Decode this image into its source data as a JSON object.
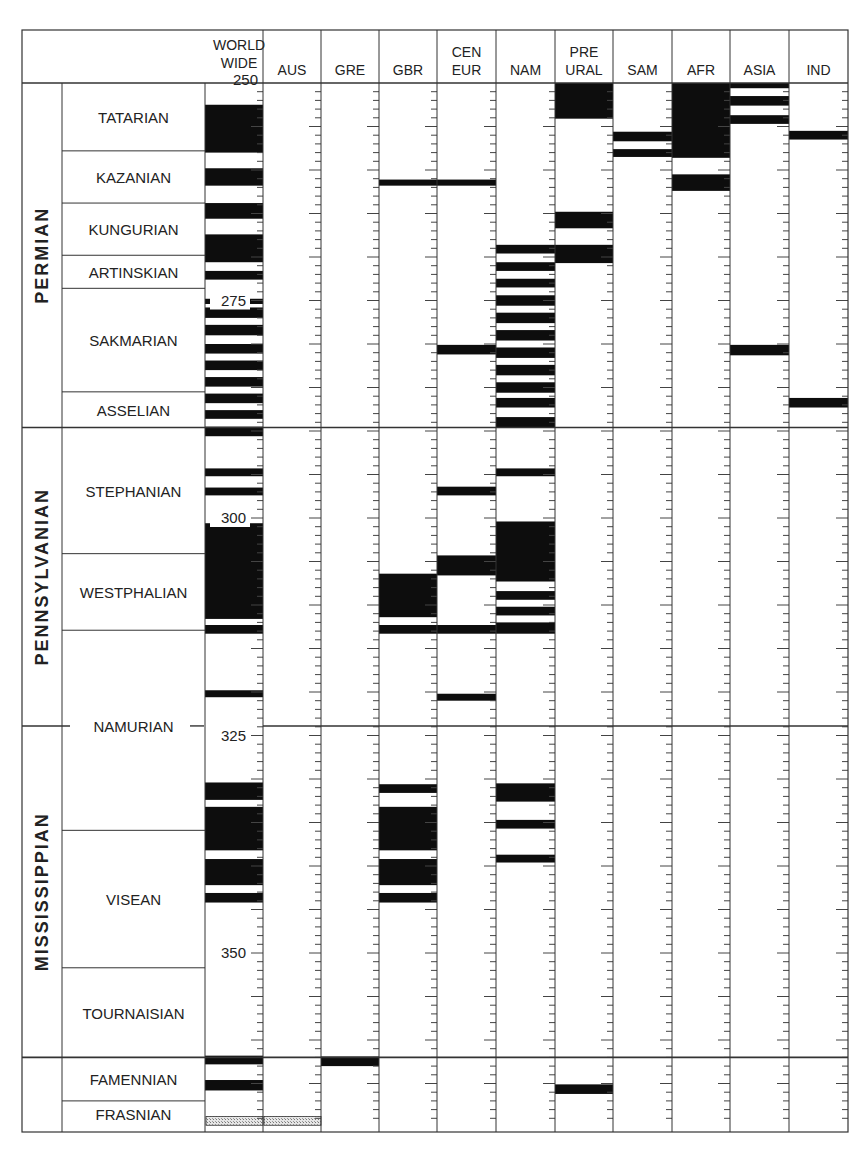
{
  "chart_data": {
    "type": "table",
    "y_axis": {
      "label": "Age (Ma)",
      "ticks": [
        250,
        275,
        300,
        325,
        350
      ],
      "range": [
        250,
        370
      ],
      "direction": "down"
    },
    "columns": [
      {
        "key": "WW",
        "label_lines": [
          "WORLD",
          "WIDE"
        ]
      },
      {
        "key": "AUS",
        "label_lines": [
          "AUS"
        ]
      },
      {
        "key": "GRE",
        "label_lines": [
          "GRE"
        ]
      },
      {
        "key": "GBR",
        "label_lines": [
          "GBR"
        ]
      },
      {
        "key": "CEUR",
        "label_lines": [
          "CEN",
          "EUR"
        ]
      },
      {
        "key": "NAM",
        "label_lines": [
          "NAM"
        ]
      },
      {
        "key": "PURAL",
        "label_lines": [
          "PRE",
          "URAL"
        ]
      },
      {
        "key": "SAM",
        "label_lines": [
          "SAM"
        ]
      },
      {
        "key": "AFR",
        "label_lines": [
          "AFR"
        ]
      },
      {
        "key": "ASIA",
        "label_lines": [
          "ASIA"
        ]
      },
      {
        "key": "IND",
        "label_lines": [
          "IND"
        ]
      }
    ],
    "periods": [
      {
        "name": "PERMIAN",
        "from": 250,
        "to": 289.6
      },
      {
        "name": "PENNSYLVANIAN",
        "from": 289.6,
        "to": 323.9
      },
      {
        "name": "MISSISSIPPIAN",
        "from": 323.9,
        "to": 362.0
      },
      {
        "name": "",
        "from": 362.0,
        "to": 370.0
      }
    ],
    "stages": [
      {
        "name": "TATARIAN",
        "from": 250,
        "to": 257.8
      },
      {
        "name": "KAZANIAN",
        "from": 257.8,
        "to": 263.8
      },
      {
        "name": "KUNGURIAN",
        "from": 263.8,
        "to": 269.8
      },
      {
        "name": "ARTINSKIAN",
        "from": 269.8,
        "to": 273.6
      },
      {
        "name": "SAKMARIAN",
        "from": 273.6,
        "to": 285.5
      },
      {
        "name": "ASSELIAN",
        "from": 285.5,
        "to": 289.6
      },
      {
        "name": "STEPHANIAN",
        "from": 289.6,
        "to": 304.1
      },
      {
        "name": "WESTPHALIAN",
        "from": 304.1,
        "to": 312.9
      },
      {
        "name": "NAMURIAN",
        "from": 312.9,
        "to": 335.9,
        "label_at": 323.9
      },
      {
        "name": "VISEAN",
        "from": 335.9,
        "to": 351.7
      },
      {
        "name": "TOURNAISIAN",
        "from": 351.7,
        "to": 362.0
      },
      {
        "name": "FAMENNIAN",
        "from": 362.0,
        "to": 367.0
      },
      {
        "name": "FRASNIAN",
        "from": 367.0,
        "to": 370.0
      }
    ],
    "series": [
      {
        "name": "WW",
        "normal_polarity_intervals_ma": [
          [
            252.5,
            258.0
          ],
          [
            259.8,
            261.8
          ],
          [
            263.8,
            265.6
          ],
          [
            267.4,
            270.6
          ],
          [
            271.6,
            272.6
          ],
          [
            274.8,
            275.4
          ],
          [
            275.8,
            277.0
          ],
          [
            277.8,
            279.0
          ],
          [
            280.0,
            281.1
          ],
          [
            281.9,
            283.0
          ],
          [
            283.8,
            284.9
          ],
          [
            285.7,
            286.8
          ],
          [
            287.6,
            288.6
          ],
          [
            289.5,
            290.6
          ],
          [
            294.3,
            295.2
          ],
          [
            296.5,
            297.4
          ],
          [
            300.6,
            311.6
          ],
          [
            312.3,
            313.3
          ],
          [
            319.8,
            320.6
          ],
          [
            330.4,
            332.4
          ],
          [
            333.2,
            338.2
          ],
          [
            339.2,
            342.2
          ],
          [
            343.1,
            344.2
          ],
          [
            361.8,
            362.8
          ],
          [
            364.6,
            365.8
          ]
        ],
        "hatched_interval_ma": [
          368.8,
          369.8
        ]
      },
      {
        "name": "AUS",
        "normal_polarity_intervals_ma": [],
        "hatched_interval_ma": [
          368.8,
          369.8
        ]
      },
      {
        "name": "GRE",
        "normal_polarity_intervals_ma": [
          [
            361.9,
            363.0
          ]
        ]
      },
      {
        "name": "GBR",
        "normal_polarity_intervals_ma": [
          [
            261.1,
            261.8
          ],
          [
            306.4,
            311.4
          ],
          [
            312.3,
            313.3
          ],
          [
            330.6,
            331.6
          ],
          [
            333.2,
            338.2
          ],
          [
            339.2,
            342.2
          ],
          [
            343.1,
            344.2
          ]
        ]
      },
      {
        "name": "CEUR",
        "normal_polarity_intervals_ma": [
          [
            261.1,
            261.8
          ],
          [
            280.1,
            281.2
          ],
          [
            296.4,
            297.4
          ],
          [
            304.3,
            306.6
          ],
          [
            312.3,
            313.3
          ],
          [
            320.2,
            321.0
          ]
        ]
      },
      {
        "name": "NAM",
        "normal_polarity_intervals_ma": [
          [
            268.6,
            269.6
          ],
          [
            270.6,
            271.6
          ],
          [
            272.5,
            273.5
          ],
          [
            274.4,
            275.6
          ],
          [
            276.4,
            277.6
          ],
          [
            278.4,
            279.6
          ],
          [
            280.4,
            281.6
          ],
          [
            282.4,
            283.6
          ],
          [
            284.4,
            285.6
          ],
          [
            286.2,
            287.3
          ],
          [
            288.4,
            289.6
          ],
          [
            294.3,
            295.2
          ],
          [
            300.4,
            307.3
          ],
          [
            308.4,
            309.4
          ],
          [
            310.2,
            311.2
          ],
          [
            312.0,
            313.3
          ],
          [
            330.5,
            332.6
          ],
          [
            334.7,
            335.7
          ],
          [
            338.7,
            339.6
          ]
        ]
      },
      {
        "name": "PURAL",
        "normal_polarity_intervals_ma": [
          [
            250.0,
            254.1
          ],
          [
            264.8,
            266.7
          ],
          [
            268.6,
            270.7
          ],
          [
            365.1,
            366.2
          ]
        ]
      },
      {
        "name": "SAM",
        "normal_polarity_intervals_ma": [
          [
            255.6,
            256.7
          ],
          [
            257.6,
            258.5
          ]
        ]
      },
      {
        "name": "AFR",
        "normal_polarity_intervals_ma": [
          [
            250.0,
            258.6
          ],
          [
            260.5,
            262.4
          ]
        ]
      },
      {
        "name": "ASIA",
        "normal_polarity_intervals_ma": [
          [
            250.0,
            250.6
          ],
          [
            251.5,
            252.6
          ],
          [
            253.7,
            254.7
          ],
          [
            280.1,
            281.3
          ]
        ]
      },
      {
        "name": "IND",
        "normal_polarity_intervals_ma": [
          [
            255.5,
            256.5
          ],
          [
            286.2,
            287.3
          ]
        ]
      }
    ],
    "legend": {
      "black": "normal polarity",
      "white": "reversed polarity",
      "hatched": "uncertain / mixed"
    },
    "grid": false
  },
  "layout": {
    "px_per_ma": 8.7,
    "y_at_250": 83,
    "bottom_y": 1132,
    "header_top": 30,
    "col_edges": [
      205,
      263,
      321,
      379,
      437,
      496,
      555,
      613,
      672,
      730,
      789,
      848
    ],
    "frame_left": 22,
    "period_right": 62,
    "colors": {
      "bar": "#0d0d0d",
      "line": "#333333",
      "tick": "#444444",
      "hatch": "#bdbdbd",
      "bg": "#ffffff"
    }
  }
}
